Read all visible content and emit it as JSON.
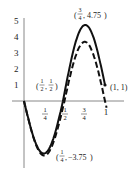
{
  "chart_data": {
    "type": "line",
    "title": "",
    "xlabel": "",
    "ylabel": "",
    "xlim": [
      0,
      1
    ],
    "ylim": [
      -4,
      5
    ],
    "x_ticks": [
      {
        "value": 0.25,
        "num": "1",
        "den": "4"
      },
      {
        "value": 0.5,
        "num": "1",
        "den": "2"
      },
      {
        "value": 0.75,
        "num": "3",
        "den": "4"
      },
      {
        "value": 1,
        "label": "1"
      }
    ],
    "y_ticks": [
      1,
      2,
      3,
      4,
      5
    ],
    "grid": false,
    "series": [
      {
        "name": "solid",
        "style": "solid",
        "formula": "x - 4 sin(2πx)",
        "points": [
          [
            0,
            0
          ],
          [
            0.25,
            -3.75
          ],
          [
            0.5,
            0.5
          ],
          [
            0.75,
            4.75
          ],
          [
            1,
            1
          ]
        ]
      },
      {
        "name": "dashed",
        "style": "dashed",
        "formula": "-4 sin(2πx) (approx.)",
        "points": [
          [
            0,
            0
          ],
          [
            0.25,
            -3.9
          ],
          [
            0.5,
            0
          ],
          [
            0.75,
            3.7
          ],
          [
            1,
            0
          ]
        ]
      }
    ],
    "annotations": [
      {
        "id": "max",
        "text_num": "3",
        "text_den": "4",
        "text_val": "4.75",
        "x": 0.75,
        "y": 4.75
      },
      {
        "id": "mid",
        "text_num": "1",
        "text_den": "2",
        "text_val_num": "1",
        "text_val_den": "2",
        "x": 0.5,
        "y": 0.5
      },
      {
        "id": "end",
        "text": "(1, 1)",
        "x": 1,
        "y": 1
      },
      {
        "id": "min",
        "text_num": "1",
        "text_den": "4",
        "text_val": "−3.75",
        "x": 0.25,
        "y": -3.75
      }
    ]
  }
}
